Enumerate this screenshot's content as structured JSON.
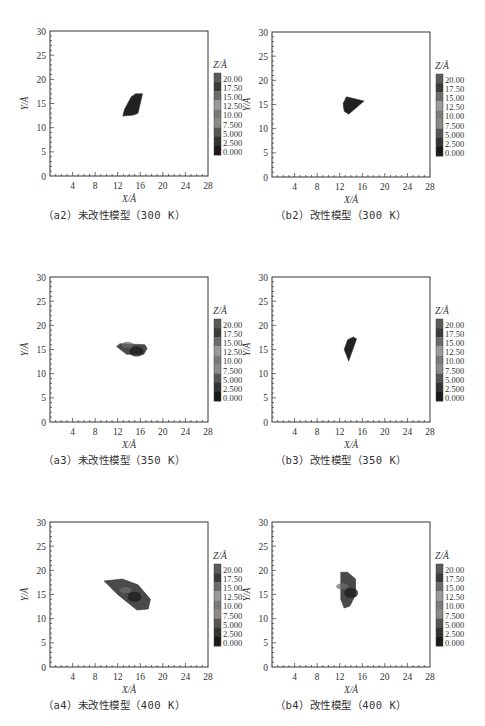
{
  "chart_data": [
    {
      "id": "a2",
      "type": "heatmap",
      "caption": "（a2）未改性模型（300 K）",
      "xlabel": "X/Å",
      "ylabel": "Y/Å",
      "colorbar_title": "Z/Å",
      "xticks": [
        4,
        8,
        12,
        16,
        20,
        24,
        28
      ],
      "yticks": [
        0,
        5,
        10,
        15,
        20,
        25,
        30
      ],
      "xlim": [
        0,
        28
      ],
      "ylim": [
        0,
        30
      ],
      "colorbar_ticks": [
        "20.00",
        "17.50",
        "15.00",
        "12.50",
        "10.00",
        "7.500",
        "5.000",
        "2.500",
        "0.000"
      ],
      "region": [
        [
          12.9,
          12.4
        ],
        [
          13.2,
          13.8
        ],
        [
          14.4,
          16.4
        ],
        [
          15.2,
          17.0
        ],
        [
          16.4,
          17.0
        ],
        [
          15.6,
          13.0
        ],
        [
          14.8,
          12.6
        ]
      ],
      "dominant_z": "low (0–5 Å, dark)"
    },
    {
      "id": "b2",
      "type": "heatmap",
      "caption": "（b2）改性模型（300 K）",
      "xlabel": "X/Å",
      "ylabel": "Y/Å",
      "colorbar_title": "Z/Å",
      "xticks": [
        4,
        8,
        12,
        16,
        20,
        24,
        28
      ],
      "yticks": [
        0,
        5,
        10,
        15,
        20,
        25,
        30
      ],
      "xlim": [
        0,
        28
      ],
      "ylim": [
        0,
        30
      ],
      "colorbar_ticks": [
        "20.00",
        "17.50",
        "15.00",
        "12.50",
        "10.00",
        "7.500",
        "5.000",
        "2.500",
        "0.000"
      ],
      "region": [
        [
          12.6,
          15.2
        ],
        [
          13.2,
          16.6
        ],
        [
          16.3,
          15.7
        ],
        [
          13.6,
          13.0
        ],
        [
          12.8,
          13.6
        ]
      ],
      "dominant_z": "low (0–5 Å, dark)"
    },
    {
      "id": "a3",
      "type": "heatmap",
      "caption": "（a3）未改性模型（350 K）",
      "xlabel": "X/Å",
      "ylabel": "Y/Å",
      "colorbar_title": "Z/Å",
      "xticks": [
        4,
        8,
        12,
        16,
        20,
        24,
        28
      ],
      "yticks": [
        0,
        5,
        10,
        15,
        20,
        25,
        30
      ],
      "xlim": [
        0,
        28
      ],
      "ylim": [
        0,
        30
      ],
      "colorbar_ticks": [
        "20.00",
        "17.50",
        "15.00",
        "12.50",
        "10.00",
        "7.500",
        "5.000",
        "2.500",
        "0.000"
      ],
      "region": [
        [
          11.8,
          15.6
        ],
        [
          12.4,
          16.2
        ],
        [
          16.8,
          16.0
        ],
        [
          17.2,
          15.2
        ],
        [
          16.6,
          14.0
        ],
        [
          13.6,
          14.0
        ]
      ],
      "dominant_z": "mixed (2.5–10 Å)"
    },
    {
      "id": "b3",
      "type": "heatmap",
      "caption": "（b3）改性模型（350 K）",
      "xlabel": "X/Å",
      "ylabel": "Y/Å",
      "colorbar_title": "Z/Å",
      "xticks": [
        4,
        8,
        12,
        16,
        20,
        24,
        28
      ],
      "yticks": [
        0,
        5,
        10,
        15,
        20,
        25,
        30
      ],
      "xlim": [
        0,
        28
      ],
      "ylim": [
        0,
        30
      ],
      "colorbar_ticks": [
        "20.00",
        "17.50",
        "15.00",
        "12.50",
        "10.00",
        "7.500",
        "5.000",
        "2.500",
        "0.000"
      ],
      "region": [
        [
          12.8,
          15.0
        ],
        [
          13.4,
          17.0
        ],
        [
          14.4,
          17.6
        ],
        [
          15.0,
          17.2
        ],
        [
          13.6,
          12.6
        ]
      ],
      "dominant_z": "low (0–5 Å, dark)"
    },
    {
      "id": "a4",
      "type": "heatmap",
      "caption": "（a4）未改性模型（400 K）",
      "xlabel": "X/Å",
      "ylabel": "Y/Å",
      "colorbar_title": "Z/Å",
      "xticks": [
        4,
        8,
        12,
        16,
        20,
        24,
        28
      ],
      "yticks": [
        0,
        5,
        10,
        15,
        20,
        25,
        30
      ],
      "xlim": [
        0,
        28
      ],
      "ylim": [
        0,
        30
      ],
      "colorbar_ticks": [
        "20.00",
        "17.50",
        "15.00",
        "12.50",
        "10.00",
        "7.500",
        "5.000",
        "2.500",
        "0.000"
      ],
      "region": [
        [
          9.6,
          17.8
        ],
        [
          12.8,
          18.2
        ],
        [
          15.6,
          17.0
        ],
        [
          17.8,
          14.0
        ],
        [
          17.4,
          12.0
        ],
        [
          15.4,
          11.8
        ],
        [
          12.0,
          15.0
        ]
      ],
      "dominant_z": "mixed (0–15 Å)"
    },
    {
      "id": "b4",
      "type": "heatmap",
      "caption": "（b4）改性模型（400 K）",
      "xlabel": "X/Å",
      "ylabel": "Y/Å",
      "colorbar_title": "Z/Å",
      "xticks": [
        4,
        8,
        12,
        16,
        20,
        24,
        28
      ],
      "yticks": [
        0,
        5,
        10,
        15,
        20,
        25,
        30
      ],
      "xlim": [
        0,
        28
      ],
      "ylim": [
        0,
        30
      ],
      "colorbar_ticks": [
        "20.00",
        "17.50",
        "15.00",
        "12.50",
        "10.00",
        "7.500",
        "5.000",
        "2.500",
        "0.000"
      ],
      "region": [
        [
          12.2,
          19.6
        ],
        [
          13.4,
          19.6
        ],
        [
          14.8,
          18.2
        ],
        [
          14.8,
          15.0
        ],
        [
          13.8,
          12.6
        ],
        [
          12.8,
          12.2
        ],
        [
          12.2,
          14.0
        ]
      ],
      "dominant_z": "mixed (0–10 Å)"
    }
  ],
  "colorbar_colors": [
    "#5a5a5a",
    "#3b3b3b",
    "#6b6b6b",
    "#9a9a9a",
    "#7a7a7a",
    "#8a8a8a",
    "#555555",
    "#333333",
    "#1a1a1a"
  ]
}
